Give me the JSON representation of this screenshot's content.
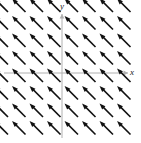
{
  "figure": {
    "type": "vector-field",
    "background_color": "#ffffff",
    "width": 141,
    "height": 143
  },
  "axes": {
    "x_label": "x",
    "y_label": "y",
    "axis_color": "#b0b0b0",
    "origin_px": {
      "x": 62,
      "y": 73
    },
    "x_axis": {
      "from_px": 4,
      "to_px": 128,
      "y_px": 73,
      "has_arrowhead": true
    },
    "y_axis": {
      "from_px": 138,
      "to_px": 14,
      "x_px": 62,
      "has_arrowhead": true
    }
  },
  "chart_data": {
    "type": "scatter",
    "title": "",
    "xlabel": "x",
    "ylabel": "y",
    "grid": false,
    "legend": null,
    "arrow_color": "#111111",
    "arrow_angle_deg": 135,
    "arrow_length_px": 19,
    "arrow_head_length_px": 6,
    "arrow_shaft_width_px": 1.6,
    "grid_spacing_px": {
      "x": 17.5,
      "y": 17.5
    },
    "grid_origin_px": {
      "x": 8,
      "y": 12
    },
    "grid_columns": 8,
    "grid_rows": 8,
    "vector": {
      "u": -1,
      "v": 1
    },
    "series": [
      {
        "name": "direction-field",
        "uniform_vector": {
          "u": -1,
          "v": 1
        },
        "points": [
          {
            "x": 8,
            "y": 12
          },
          {
            "x": 25.5,
            "y": 12
          },
          {
            "x": 43,
            "y": 12
          },
          {
            "x": 60.5,
            "y": 12
          },
          {
            "x": 78,
            "y": 12
          },
          {
            "x": 95.5,
            "y": 12
          },
          {
            "x": 113,
            "y": 12
          },
          {
            "x": 130.5,
            "y": 12
          },
          {
            "x": 8,
            "y": 29.5
          },
          {
            "x": 25.5,
            "y": 29.5
          },
          {
            "x": 43,
            "y": 29.5
          },
          {
            "x": 60.5,
            "y": 29.5
          },
          {
            "x": 78,
            "y": 29.5
          },
          {
            "x": 95.5,
            "y": 29.5
          },
          {
            "x": 113,
            "y": 29.5
          },
          {
            "x": 130.5,
            "y": 29.5
          },
          {
            "x": 8,
            "y": 47
          },
          {
            "x": 25.5,
            "y": 47
          },
          {
            "x": 43,
            "y": 47
          },
          {
            "x": 60.5,
            "y": 47
          },
          {
            "x": 78,
            "y": 47
          },
          {
            "x": 95.5,
            "y": 47
          },
          {
            "x": 113,
            "y": 47
          },
          {
            "x": 130.5,
            "y": 47
          },
          {
            "x": 8,
            "y": 64.5
          },
          {
            "x": 25.5,
            "y": 64.5
          },
          {
            "x": 43,
            "y": 64.5
          },
          {
            "x": 60.5,
            "y": 64.5
          },
          {
            "x": 78,
            "y": 64.5
          },
          {
            "x": 95.5,
            "y": 64.5
          },
          {
            "x": 113,
            "y": 64.5
          },
          {
            "x": 130.5,
            "y": 64.5
          },
          {
            "x": 8,
            "y": 82
          },
          {
            "x": 25.5,
            "y": 82
          },
          {
            "x": 43,
            "y": 82
          },
          {
            "x": 60.5,
            "y": 82
          },
          {
            "x": 78,
            "y": 82
          },
          {
            "x": 95.5,
            "y": 82
          },
          {
            "x": 113,
            "y": 82
          },
          {
            "x": 130.5,
            "y": 82
          },
          {
            "x": 8,
            "y": 99.5
          },
          {
            "x": 25.5,
            "y": 99.5
          },
          {
            "x": 43,
            "y": 99.5
          },
          {
            "x": 60.5,
            "y": 99.5
          },
          {
            "x": 78,
            "y": 99.5
          },
          {
            "x": 95.5,
            "y": 99.5
          },
          {
            "x": 113,
            "y": 99.5
          },
          {
            "x": 130.5,
            "y": 99.5
          },
          {
            "x": 8,
            "y": 117
          },
          {
            "x": 25.5,
            "y": 117
          },
          {
            "x": 43,
            "y": 117
          },
          {
            "x": 60.5,
            "y": 117
          },
          {
            "x": 78,
            "y": 117
          },
          {
            "x": 95.5,
            "y": 117
          },
          {
            "x": 113,
            "y": 117
          },
          {
            "x": 130.5,
            "y": 117
          },
          {
            "x": 8,
            "y": 134.5
          },
          {
            "x": 25.5,
            "y": 134.5
          },
          {
            "x": 43,
            "y": 134.5
          },
          {
            "x": 60.5,
            "y": 134.5
          },
          {
            "x": 78,
            "y": 134.5
          },
          {
            "x": 95.5,
            "y": 134.5
          },
          {
            "x": 113,
            "y": 134.5
          },
          {
            "x": 130.5,
            "y": 134.5
          }
        ]
      }
    ]
  }
}
